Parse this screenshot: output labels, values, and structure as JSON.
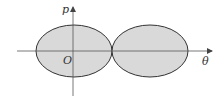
{
  "figure": {
    "labels": {
      "y_axis": "p",
      "x_axis": "θ",
      "origin": "O"
    },
    "colors": {
      "fill": "#d9d9d9",
      "stroke": "#333333",
      "axis": "#555555"
    },
    "shapes": [
      {
        "type": "ellipse",
        "name": "left-lobe",
        "cx": 74,
        "cy": 51,
        "rx": 38,
        "ry": 26
      },
      {
        "type": "ellipse",
        "name": "right-lobe",
        "cx": 150,
        "cy": 51,
        "rx": 38,
        "ry": 26
      }
    ],
    "axes": {
      "horizontal": {
        "x1": 17,
        "x2": 212,
        "y": 51
      },
      "vertical": {
        "x": 73,
        "y1": 96,
        "y2": 7
      }
    }
  }
}
